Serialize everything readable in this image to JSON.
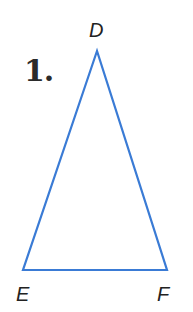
{
  "problem": {
    "number_label": "1."
  },
  "triangle": {
    "stroke_color": "#3a7bd5",
    "stroke_width": 2.2,
    "vertices": {
      "D": {
        "label": "D",
        "x": 97,
        "y": 51
      },
      "E": {
        "label": "E",
        "x": 23,
        "y": 270
      },
      "F": {
        "label": "F",
        "x": 167,
        "y": 270
      }
    }
  }
}
